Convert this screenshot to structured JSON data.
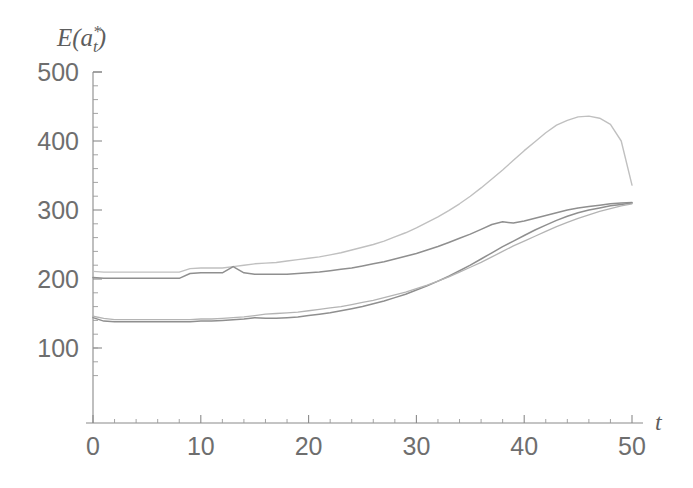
{
  "chart_data": {
    "type": "line",
    "title": "",
    "subtitle": "",
    "xlabel": "t",
    "ylabel": "E(a*_t)",
    "ylabel_parts": {
      "base": "E(a",
      "sup": "*",
      "sub": "t",
      "close": ")"
    },
    "xlim": [
      0,
      50
    ],
    "ylim": [
      100,
      500
    ],
    "xticks": [
      0,
      10,
      20,
      30,
      40,
      50
    ],
    "xticklabels": [
      "0",
      "10",
      "20",
      "30",
      "40",
      "50"
    ],
    "yticks": [
      100,
      200,
      300,
      400,
      500
    ],
    "yticklabels": [
      "100",
      "200",
      "300",
      "400",
      "500"
    ],
    "x_minor_interval": 2,
    "y_minor_interval": 20,
    "grid": false,
    "legend": "none",
    "axis_color": "#8a8a8a",
    "x": [
      0,
      1,
      2,
      3,
      4,
      5,
      6,
      7,
      8,
      9,
      10,
      11,
      12,
      13,
      14,
      15,
      16,
      17,
      18,
      19,
      20,
      21,
      22,
      23,
      24,
      25,
      26,
      27,
      28,
      29,
      30,
      31,
      32,
      33,
      34,
      35,
      36,
      37,
      38,
      39,
      40,
      41,
      42,
      43,
      44,
      45,
      46,
      47,
      48,
      49,
      50
    ],
    "series": [
      {
        "name": "upper-light",
        "color": "#c0c0c0",
        "width": 1.4,
        "values": [
          211,
          210,
          210,
          210,
          210,
          210,
          210,
          210,
          210,
          215,
          216,
          216,
          216,
          218,
          220,
          222,
          223,
          224,
          226,
          228,
          230,
          232,
          235,
          238,
          242,
          246,
          250,
          255,
          261,
          267,
          274,
          282,
          290,
          299,
          309,
          320,
          332,
          345,
          358,
          372,
          386,
          399,
          412,
          423,
          430,
          435,
          436,
          433,
          424,
          400,
          336
        ]
      },
      {
        "name": "upper-dark",
        "color": "#8f8f8f",
        "width": 1.5,
        "values": [
          202,
          201,
          201,
          201,
          201,
          201,
          201,
          201,
          201,
          208,
          209,
          209,
          209,
          218,
          209,
          207,
          207,
          207,
          207,
          208,
          209,
          210,
          212,
          214,
          216,
          219,
          222,
          225,
          229,
          233,
          237,
          242,
          247,
          253,
          259,
          265,
          272,
          279,
          283,
          281,
          284,
          288,
          292,
          296,
          300,
          303,
          305,
          307,
          309,
          310,
          311
        ]
      },
      {
        "name": "lower-dark",
        "color": "#8f8f8f",
        "width": 1.5,
        "values": [
          144,
          139,
          138,
          138,
          138,
          138,
          138,
          138,
          138,
          138,
          139,
          139,
          140,
          141,
          142,
          144,
          143,
          143,
          144,
          145,
          147,
          149,
          151,
          154,
          157,
          160,
          164,
          168,
          173,
          178,
          184,
          190,
          197,
          204,
          212,
          220,
          229,
          238,
          247,
          255,
          263,
          271,
          278,
          285,
          291,
          296,
          300,
          303,
          306,
          308,
          310
        ]
      },
      {
        "name": "lower-light",
        "color": "#b4b4b4",
        "width": 1.3,
        "values": [
          146,
          143,
          141,
          141,
          141,
          141,
          141,
          141,
          141,
          141,
          142,
          142,
          143,
          144,
          145,
          147,
          149,
          150,
          151,
          152,
          154,
          156,
          158,
          160,
          163,
          166,
          169,
          173,
          177,
          181,
          186,
          191,
          197,
          203,
          210,
          217,
          224,
          232,
          240,
          248,
          255,
          262,
          269,
          276,
          282,
          288,
          293,
          298,
          302,
          306,
          309
        ]
      }
    ]
  },
  "plot_geometry": {
    "x0_px": 93,
    "x50_px": 632,
    "y500_px": 72,
    "y100_px": 348,
    "x_axis_px": 423
  }
}
